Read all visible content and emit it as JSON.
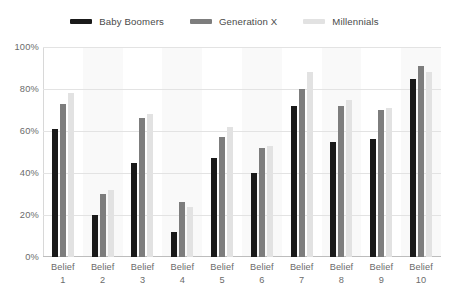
{
  "chart_data": {
    "type": "bar",
    "title": "",
    "xlabel": "",
    "ylabel": "",
    "ylim": [
      0,
      100
    ],
    "ytick_labels": [
      "100%",
      "80%",
      "60%",
      "40%",
      "20%",
      "0%"
    ],
    "ytick_values": [
      100,
      80,
      60,
      40,
      20,
      0
    ],
    "grid": true,
    "legend_position": "top-center",
    "categories": [
      "Belief 1",
      "Belief 2",
      "Belief 3",
      "Belief 4",
      "Belief 5",
      "Belief 6",
      "Belief 7",
      "Belief 8",
      "Belief 9",
      "Belief 10"
    ],
    "category_lines": [
      {
        "label": "Belief",
        "num": "1"
      },
      {
        "label": "Belief",
        "num": "2"
      },
      {
        "label": "Belief",
        "num": "3"
      },
      {
        "label": "Belief",
        "num": "4"
      },
      {
        "label": "Belief",
        "num": "5"
      },
      {
        "label": "Belief",
        "num": "6"
      },
      {
        "label": "Belief",
        "num": "7"
      },
      {
        "label": "Belief",
        "num": "8"
      },
      {
        "label": "Belief",
        "num": "9"
      },
      {
        "label": "Belief",
        "num": "10"
      }
    ],
    "series": [
      {
        "name": "Baby Boomers",
        "color": "#1a1a1a",
        "values": [
          61,
          20,
          45,
          12,
          47,
          40,
          72,
          55,
          56,
          85
        ]
      },
      {
        "name": "Generation X",
        "color": "#7d7d7d",
        "values": [
          73,
          30,
          66,
          26,
          57,
          52,
          80,
          72,
          70,
          91
        ]
      },
      {
        "name": "Millennials",
        "color": "#e2e2e2",
        "values": [
          78,
          32,
          68,
          24,
          62,
          53,
          88,
          75,
          71,
          88
        ]
      }
    ]
  },
  "legend": {
    "entries": [
      {
        "label": "Baby Boomers",
        "color": "#1a1a1a"
      },
      {
        "label": "Generation X",
        "color": "#7d7d7d"
      },
      {
        "label": "Millennials",
        "color": "#e2e2e2"
      }
    ]
  },
  "colors": {
    "background": "#ffffff",
    "gridline": "#e3e3e3",
    "axis": "#bdbdbd",
    "tick_text": "#6b6b6b",
    "legend_text": "#4a4a4a",
    "band": "#f7f7f7"
  }
}
